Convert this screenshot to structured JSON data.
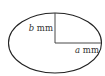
{
  "diagram": {
    "shape": "ellipse",
    "colors": {
      "stroke": "#222222",
      "text": "#333333",
      "background": "#ffffff"
    },
    "labels": {
      "vertical_semi_axis": {
        "variable": "b",
        "unit": " mm"
      },
      "horizontal_semi_axis": {
        "variable": "a",
        "unit": " mm"
      }
    }
  }
}
